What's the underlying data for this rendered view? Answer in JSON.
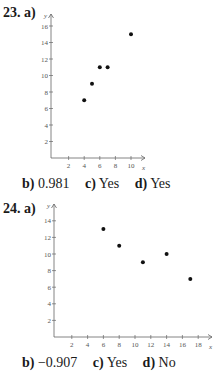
{
  "problems": [
    {
      "number": "23.",
      "part_a": "a)",
      "answers": [
        {
          "label": "b)",
          "value": "0.981"
        },
        {
          "label": "c)",
          "value": "Yes"
        },
        {
          "label": "d)",
          "value": "Yes"
        }
      ]
    },
    {
      "number": "24.",
      "part_a": "a)",
      "answers": [
        {
          "label": "b)",
          "value": "−0.907"
        },
        {
          "label": "c)",
          "value": "Yes"
        },
        {
          "label": "d)",
          "value": "No"
        }
      ]
    }
  ],
  "chart_data": [
    {
      "type": "scatter",
      "title": "23. a)",
      "xlabel": "x",
      "ylabel": "y",
      "x": [
        4,
        5,
        6,
        7,
        10
      ],
      "y": [
        7,
        9,
        11,
        11,
        15
      ],
      "xticks": [
        2,
        4,
        6,
        8,
        10
      ],
      "yticks": [
        2,
        4,
        6,
        8,
        10,
        12,
        14,
        16
      ],
      "xlim": [
        0,
        11
      ],
      "ylim": [
        0,
        17
      ],
      "grid": false
    },
    {
      "type": "scatter",
      "title": "24. a)",
      "xlabel": "x",
      "ylabel": "y",
      "x": [
        6,
        8,
        11,
        14,
        17
      ],
      "y": [
        13,
        11,
        9,
        10,
        7
      ],
      "xticks": [
        2,
        4,
        6,
        8,
        10,
        12,
        14,
        16,
        18
      ],
      "yticks": [
        2,
        4,
        6,
        8,
        10,
        12,
        14
      ],
      "xlim": [
        0,
        19
      ],
      "ylim": [
        0,
        15
      ],
      "grid": false
    }
  ]
}
